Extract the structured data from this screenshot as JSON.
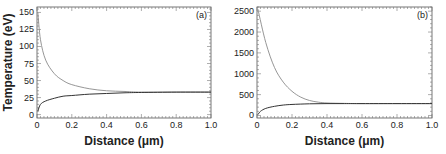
{
  "chart_data": [
    {
      "type": "line",
      "panel_label": "(a)",
      "xlabel": "Distance (μm)",
      "ylabel": "Temperature (eV)",
      "xlim": [
        0,
        1.0
      ],
      "ylim": [
        -5,
        158
      ],
      "xticks": [
        0,
        0.2,
        0.4,
        0.6,
        0.8,
        1.0
      ],
      "xtick_labels": [
        "0",
        "0.2",
        "0.4",
        "0.6",
        "0.8",
        "1.0"
      ],
      "yticks": [
        0,
        25,
        50,
        75,
        100,
        125,
        150
      ],
      "ytick_labels": [
        "0",
        "25",
        "50",
        "75",
        "100",
        "125",
        "150"
      ],
      "grid": false,
      "series": [
        {
          "name": "upper (decaying)",
          "color": "#8a8a8a",
          "x": [
            0.005,
            0.02,
            0.05,
            0.1,
            0.15,
            0.2,
            0.3,
            0.4,
            0.5,
            0.6,
            0.8,
            1.0
          ],
          "y": [
            150,
            110,
            80,
            60,
            50,
            44,
            38,
            35,
            34,
            33,
            33,
            33
          ]
        },
        {
          "name": "lower (rising)",
          "color": "#333333",
          "x": [
            0.005,
            0.02,
            0.05,
            0.1,
            0.15,
            0.2,
            0.3,
            0.4,
            0.5,
            0.6,
            0.8,
            1.0
          ],
          "y": [
            5,
            15,
            20,
            24,
            27,
            28,
            30,
            31,
            32,
            32.5,
            33,
            33
          ]
        }
      ]
    },
    {
      "type": "line",
      "panel_label": "(b)",
      "xlabel": "Distance (μm)",
      "ylabel": "",
      "xlim": [
        0,
        1.0
      ],
      "ylim": [
        -60,
        2600
      ],
      "xticks": [
        0,
        0.2,
        0.4,
        0.6,
        0.8,
        1.0
      ],
      "xtick_labels": [
        "0",
        "0.2",
        "0.4",
        "0.6",
        "0.8",
        "1.0"
      ],
      "yticks": [
        0,
        500,
        1000,
        1500,
        2000,
        2500
      ],
      "ytick_labels": [
        "0",
        "500",
        "1000",
        "1500",
        "2000",
        "2500"
      ],
      "grid": false,
      "series": [
        {
          "name": "upper (decaying)",
          "color": "#8a8a8a",
          "x": [
            0.005,
            0.05,
            0.1,
            0.15,
            0.2,
            0.25,
            0.3,
            0.35,
            0.4,
            0.5,
            0.6,
            0.8,
            1.0
          ],
          "y": [
            2550,
            1750,
            1150,
            800,
            580,
            440,
            360,
            320,
            300,
            290,
            285,
            285,
            285
          ]
        },
        {
          "name": "lower (rising)",
          "color": "#333333",
          "x": [
            0.005,
            0.02,
            0.05,
            0.1,
            0.15,
            0.2,
            0.3,
            0.4,
            0.5,
            0.6,
            0.8,
            1.0
          ],
          "y": [
            20,
            100,
            170,
            220,
            250,
            265,
            280,
            285,
            285,
            285,
            285,
            285
          ]
        }
      ]
    }
  ]
}
